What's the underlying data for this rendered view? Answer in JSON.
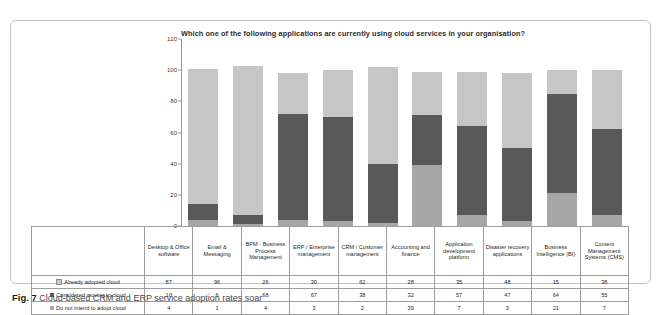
{
  "figure": {
    "caption_label": "Fig. 7",
    "caption_text": "Cloud-based CRM and ERP service adoption rates soar"
  },
  "chart_data": {
    "type": "bar",
    "subtype": "stacked-column",
    "title": "Which one of the following applications are currently using cloud services in your organisation?",
    "xlabel": "",
    "ylabel": "",
    "ylim": [
      0,
      120
    ],
    "yticks": [
      0,
      20,
      40,
      60,
      80,
      100,
      120
    ],
    "grid": false,
    "legend_position": "table-left",
    "stack_order_bottom_to_top": [
      "Do not intend to adopt cloud",
      "Considered moving to cloud",
      "Already adopted cloud"
    ],
    "categories": [
      "Desktop & Office software",
      "Email & Messaging",
      "BPM - Business Process Management",
      "ERP / Enterprise management",
      "CRM / Customer management",
      "Accounting and finance",
      "Application development platform",
      "Disaster recovery applications",
      "Business Intelligence (BI)",
      "Content Management Systems (CMS)"
    ],
    "series": [
      {
        "name": "Already adopted cloud",
        "color": "#c6c6c6",
        "values": [
          87,
          96,
          26,
          30,
          62,
          28,
          35,
          48,
          15,
          38
        ]
      },
      {
        "name": "Considered moving to cloud",
        "color": "#595959",
        "values": [
          10,
          6,
          68,
          67,
          38,
          32,
          57,
          47,
          64,
          55
        ]
      },
      {
        "name": "Do not intend to adopt cloud",
        "color": "#a6a6a6",
        "values": [
          4,
          1,
          4,
          3,
          2,
          39,
          7,
          3,
          21,
          7
        ]
      }
    ]
  },
  "table": {
    "row_labels": [
      "Already adopted cloud",
      "Considered moving to cloud",
      "Do not intend to adopt cloud"
    ],
    "column_headers": [
      "Desktop & Office software",
      "Email & Messaging",
      "BPM - Business Process Management",
      "ERP / Enterprise management",
      "CRM / Customer management",
      "Accounting and finance",
      "Application development platform",
      "Disaster recovery applications",
      "Business Intelligence (BI)",
      "Content Management Systems (CMS)"
    ],
    "rows": [
      [
        87,
        96,
        26,
        30,
        62,
        28,
        35,
        48,
        15,
        38
      ],
      [
        10,
        6,
        68,
        67,
        38,
        32,
        57,
        47,
        64,
        55
      ],
      [
        4,
        1,
        4,
        3,
        2,
        39,
        7,
        3,
        21,
        7
      ]
    ]
  },
  "colors": {
    "adopted": "#c6c6c6",
    "considered": "#595959",
    "not_intend": "#a6a6a6",
    "axis": "#9a9a9a",
    "border": "#bfc1c3"
  }
}
